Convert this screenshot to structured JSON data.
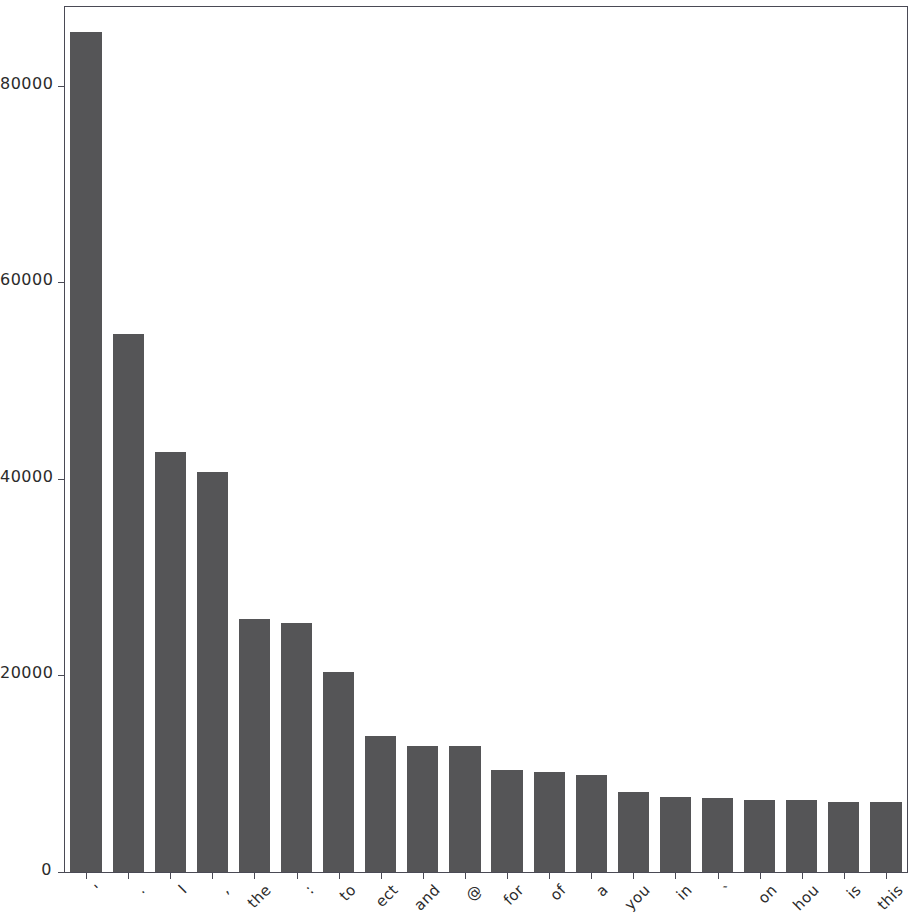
{
  "chart_data": {
    "type": "bar",
    "title": "",
    "xlabel": "",
    "ylabel": "",
    "ylim": [
      0,
      88000
    ],
    "grid": false,
    "legend": null,
    "bar_color": "#555557",
    "axis_color": "#4a4a55",
    "background": "#ffffff",
    "xtick_rotation": -45,
    "categories": [
      "'",
      ".",
      "I",
      ",",
      "the",
      ":",
      "to",
      "ect",
      "and",
      "@",
      "for",
      "of",
      "a",
      "you",
      "in",
      "`",
      "on",
      "hou",
      "is",
      "this"
    ],
    "values": [
      85500,
      54700,
      42700,
      40700,
      25700,
      25300,
      20300,
      13800,
      12800,
      12800,
      10400,
      10200,
      9900,
      8150,
      7600,
      7500,
      7350,
      7300,
      7150,
      7100
    ],
    "ytick_labels": [
      "0",
      "20000",
      "40000",
      "60000",
      "80000"
    ],
    "ytick_values": [
      0,
      20000,
      40000,
      60000,
      80000
    ]
  }
}
